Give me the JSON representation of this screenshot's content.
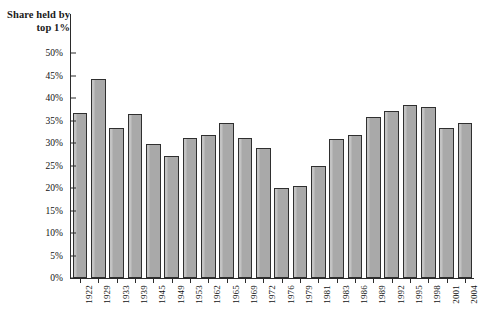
{
  "chart_data": {
    "type": "bar",
    "title": "Share held by top 1%",
    "xlabel": "",
    "ylabel": "Share held by top 1%",
    "ylim": [
      0,
      50
    ],
    "ytick_labels": [
      "0%",
      "5%",
      "10%",
      "15%",
      "20%",
      "25%",
      "30%",
      "35%",
      "40%",
      "45%",
      "50%"
    ],
    "ytick_values": [
      0,
      5,
      10,
      15,
      20,
      25,
      30,
      35,
      40,
      45,
      50
    ],
    "grid": false,
    "legend": "none",
    "value_suffix": "%",
    "categories": [
      "1922",
      "1929",
      "1933",
      "1939",
      "1945",
      "1949",
      "1953",
      "1962",
      "1965",
      "1969",
      "1972",
      "1976",
      "1979",
      "1981",
      "1983",
      "1986",
      "1989",
      "1992",
      "1995",
      "1998",
      "2001",
      "2004"
    ],
    "values": [
      36.7,
      44.2,
      33.3,
      36.4,
      29.8,
      27.1,
      31.2,
      31.8,
      34.4,
      31.1,
      29.0,
      19.9,
      20.5,
      24.8,
      30.9,
      31.8,
      35.7,
      37.2,
      38.5,
      38.1,
      33.4,
      34.4
    ]
  },
  "axis": {
    "y_tick_count": 11
  }
}
